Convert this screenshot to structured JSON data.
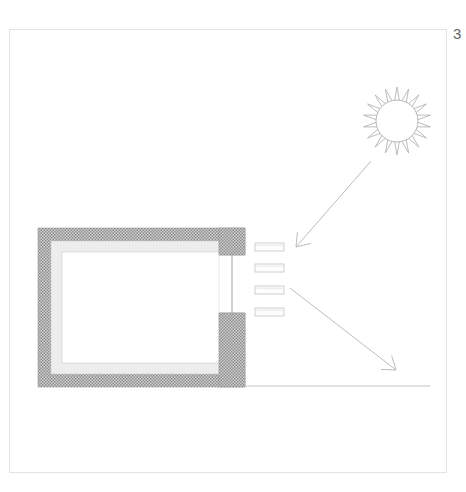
{
  "page": {
    "width": 466,
    "height": 492,
    "background_color": "#ffffff",
    "page_number": "3",
    "frame": {
      "x": 9,
      "y": 29,
      "width": 438,
      "height": 444,
      "border_color": "#e3e3e3"
    }
  },
  "diagram": {
    "type": "architectural-section",
    "colors": {
      "wall_hatch": "#9a9a9a",
      "wall_hatch_light": "#c9c9c9",
      "insulation_fill": "#ededed",
      "interior_fill": "#ffffff",
      "line": "#b5b5b5",
      "line_dark": "#8f8f8f",
      "ground_line": "#c2c2c2",
      "sun_stroke": "#b0b0b0",
      "slat_stroke": "#c4c4c4",
      "slat_fill": "#fdfdfd",
      "arrow_stroke": "#bdbdbd"
    },
    "building": {
      "label": "building-section",
      "outer": {
        "x": 38,
        "y": 228,
        "width": 207,
        "height": 159
      },
      "wall_thickness": 13,
      "insulation_thickness": 11,
      "interior": {
        "x": 62,
        "y": 252,
        "width": 183,
        "height": 111
      },
      "opening_side": "right",
      "jamb_top": {
        "x": 219,
        "y": 228,
        "width": 26,
        "height": 27
      },
      "jamb_bottom": {
        "x": 219,
        "y": 313,
        "width": 26,
        "height": 48
      },
      "glazing_line": {
        "x": 232,
        "y1": 255,
        "y2": 313
      }
    },
    "sun": {
      "label": "sun",
      "center_x": 397,
      "center_y": 121,
      "radius": 21,
      "ray_count": 18,
      "ray_length": 13
    },
    "louvres": {
      "label": "shading-louvre-slats",
      "count": 4,
      "slats": [
        {
          "x": 255,
          "y": 243,
          "width": 29,
          "height": 8
        },
        {
          "x": 255,
          "y": 264,
          "width": 29,
          "height": 8
        },
        {
          "x": 255,
          "y": 286,
          "width": 29,
          "height": 8
        },
        {
          "x": 255,
          "y": 308,
          "width": 29,
          "height": 8
        }
      ]
    },
    "arrows": [
      {
        "label": "summer-sun-ray-arrow",
        "x1": 371,
        "y1": 161,
        "x2": 296,
        "y2": 247,
        "head_size": 15
      },
      {
        "label": "winter-sun-ray-arrow",
        "x1": 290,
        "y1": 288,
        "x2": 396,
        "y2": 370,
        "head_size": 15
      }
    ],
    "ground": {
      "label": "ground-line",
      "x1": 245,
      "y1": 386,
      "x2": 430,
      "y2": 386
    }
  }
}
